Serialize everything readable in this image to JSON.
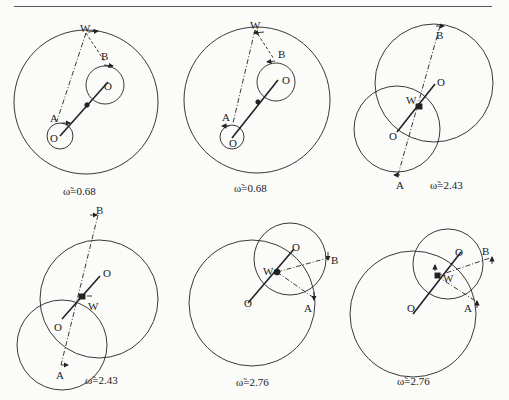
{
  "header": {
    "page_number_left": "222",
    "page_number_right": ""
  },
  "panels": [
    {
      "id": 1,
      "caption": "ω̃=0.68",
      "labels": {
        "w": "W",
        "a": "A",
        "b": "B",
        "o1": "O",
        "o2": "O"
      }
    },
    {
      "id": 2,
      "caption": "ω̃=0.68",
      "labels": {
        "w": "W",
        "a": "A",
        "b": "B",
        "o1": "O",
        "o2": "O"
      }
    },
    {
      "id": 3,
      "caption": "ω̃=2.43",
      "labels": {
        "w": "W",
        "a": "A",
        "b": "B",
        "o1": "O",
        "o2": "O"
      }
    },
    {
      "id": 4,
      "caption": "ω̃=2.43",
      "labels": {
        "w": "W",
        "a": "A",
        "b": "B",
        "o1": "O",
        "o2": "O"
      }
    },
    {
      "id": 5,
      "caption": "ω̃=2.76",
      "labels": {
        "w": "W",
        "a": "A",
        "b": "B",
        "o1": "O",
        "o2": "O"
      }
    },
    {
      "id": 6,
      "caption": "ω̃=2.76",
      "labels": {
        "w": "W",
        "a": "A",
        "b": "B",
        "o1": "O",
        "o2": "O"
      }
    }
  ],
  "colors": {
    "ink": "#222222",
    "paper": "#fbfbf9"
  }
}
